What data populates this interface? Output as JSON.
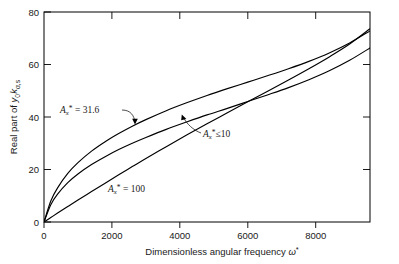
{
  "chart_data": {
    "type": "line",
    "title": "",
    "subtitle": "",
    "xlabel": "Dimensionless angular  frequency ω*",
    "ylabel": "Real part of y₀kₐ,ₛ",
    "xlim": [
      0,
      9600
    ],
    "ylim": [
      0,
      80
    ],
    "xticks": [
      0,
      2000,
      4000,
      6000,
      8000
    ],
    "xtick_labels": [
      "0",
      "2000",
      "4000",
      "6000",
      "8000"
    ],
    "yticks": [
      0,
      20,
      40,
      60,
      80
    ],
    "ytick_labels": [
      "0",
      "20",
      "40",
      "60",
      "80"
    ],
    "grid": false,
    "legend": "none (inline curve annotations)",
    "series": [
      {
        "name": "A_x* = 31.6",
        "label_parts": {
          "symbol": "A",
          "subscript": "x",
          "superscript": "*",
          "relation": "=",
          "value": "31.6"
        },
        "label_text": "Aₓ* = 31.6",
        "color": "#000000",
        "x": [
          0,
          200,
          400,
          700,
          1000,
          1400,
          1800,
          2200,
          2600,
          3000,
          3600,
          4200,
          4800,
          5400,
          6000,
          6600,
          7200,
          7800,
          8400,
          9000,
          9600
        ],
        "y": [
          0,
          8.0,
          13.0,
          18.5,
          22.6,
          27.0,
          30.6,
          33.7,
          36.5,
          39.0,
          42.4,
          45.4,
          48.2,
          50.8,
          53.3,
          55.8,
          58.4,
          61.2,
          64.4,
          68.2,
          72.8
        ]
      },
      {
        "name": "A_x* ≤ 10",
        "label_parts": {
          "symbol": "A",
          "subscript": "x",
          "superscript": "*",
          "relation": "≤",
          "value": "10"
        },
        "label_text": "Aₓ* ≤ 10",
        "color": "#000000",
        "x": [
          0,
          200,
          400,
          700,
          1000,
          1400,
          1800,
          2200,
          2600,
          3000,
          3600,
          4200,
          4800,
          5400,
          6000,
          6600,
          7200,
          7800,
          8400,
          9000,
          9600
        ],
        "y": [
          0,
          6.6,
          10.6,
          15.0,
          18.3,
          21.9,
          24.9,
          27.6,
          30.0,
          32.2,
          35.3,
          38.1,
          40.8,
          43.3,
          45.9,
          48.5,
          51.2,
          54.2,
          57.6,
          61.6,
          66.3
        ]
      },
      {
        "name": "A_x* = 100",
        "label_parts": {
          "symbol": "A",
          "subscript": "x",
          "superscript": "*",
          "relation": "=",
          "value": "100"
        },
        "label_text": "Aₓ* = 100",
        "color": "#000000",
        "x": [
          0,
          200,
          400,
          700,
          1000,
          1400,
          1800,
          2200,
          2600,
          3000,
          3600,
          4200,
          4800,
          5400,
          6000,
          6600,
          7200,
          7800,
          8400,
          9000,
          9600
        ],
        "y": [
          0,
          1.7,
          3.4,
          5.9,
          8.4,
          11.6,
          14.8,
          18.0,
          21.1,
          24.2,
          28.7,
          33.1,
          37.4,
          41.6,
          45.8,
          49.9,
          54.1,
          58.4,
          62.9,
          67.8,
          73.6
        ]
      }
    ],
    "annotations": [
      {
        "name": "annotation-a31-6",
        "text": "Aₓ* = 31.6",
        "symbol": "A",
        "subscript": "x",
        "superscript": "*",
        "relation": "=",
        "value": "31.6",
        "x_px": 60,
        "y_px": 113,
        "leader": "curve arrow pointing down-right to the A_x* = 31.6 curve"
      },
      {
        "name": "annotation-a-le-10",
        "text": "Aₓ* ≤ 10",
        "symbol": "A",
        "subscript": "x",
        "superscript": "*",
        "relation": "≤",
        "value": "10",
        "x_px": 198,
        "y_px": 133,
        "leader": "curve arrow pointing up-left to the A_x* ≤ 10 curve"
      },
      {
        "name": "annotation-a100",
        "text": "Aₓ* = 100",
        "symbol": "A",
        "subscript": "x",
        "superscript": "*",
        "relation": "=",
        "value": "100",
        "x_px": 108,
        "y_px": 188,
        "leader": "none"
      }
    ]
  },
  "axes": {
    "y_axis_title": "Real part of y₀kₐ,ₛ",
    "y_axis_title_parts": {
      "prefix": "Real part of ",
      "var1": "y",
      "var1_sub": "0",
      "var2": "k",
      "var2_sub": "α,s"
    },
    "x_axis_title": "Dimensionless angular  frequency ω*",
    "x_axis_title_parts": {
      "prefix": "Dimensionless angular  frequency ",
      "symbol": "ω",
      "superscript": "*"
    }
  },
  "colors": {
    "curve": "#000000",
    "axis": "#000000",
    "text": "#1a1a1a",
    "background": "#ffffff"
  }
}
